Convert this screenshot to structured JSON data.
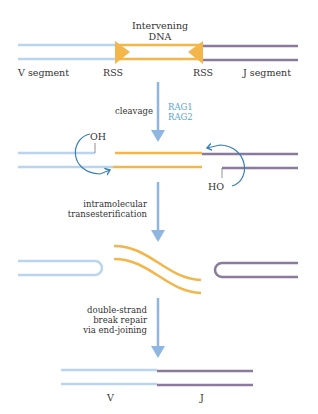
{
  "colors": {
    "v_segment": "#b9d4ec",
    "j_segment": "#8a7a9e",
    "intervening": "#f2b64a",
    "arrow": "#8fb6e0",
    "curved_arrow": "#3a7fb5",
    "enzyme_text": "#5aa3d0"
  },
  "stage1": {
    "intervening_line1": "Intervening",
    "intervening_line2": "DNA",
    "v_label": "V segment",
    "rss_left": "RSS",
    "rss_right": "RSS",
    "j_label": "J segment"
  },
  "step1": {
    "label": "cleavage",
    "enzyme1": "RAG1",
    "enzyme2": "RAG2"
  },
  "stage2": {
    "oh_label": "OH",
    "ho_label": "HO"
  },
  "step2": {
    "line1": "intramolecular",
    "line2": "transesterification"
  },
  "step3": {
    "line1": "double-strand",
    "line2": "break repair",
    "line3": "via end-joining"
  },
  "stage4": {
    "v_label": "V",
    "j_label": "J"
  }
}
